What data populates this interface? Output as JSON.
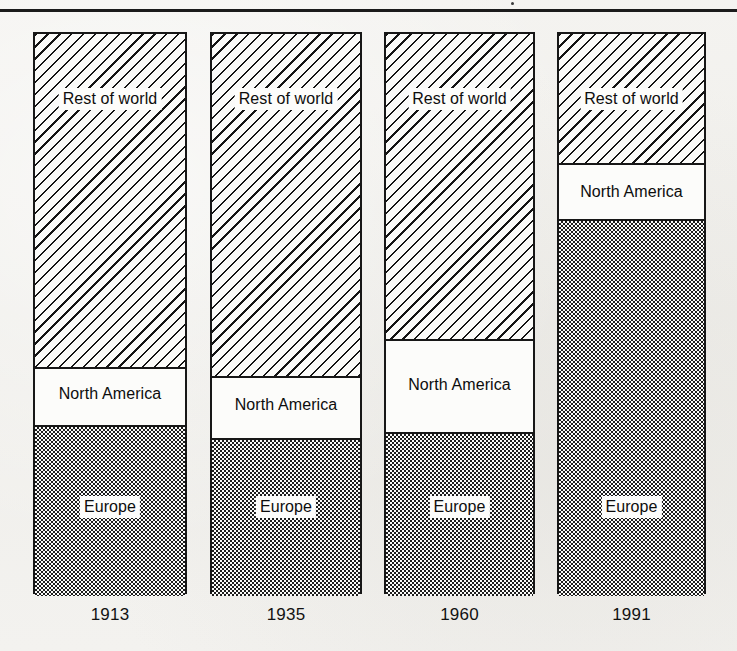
{
  "figure": {
    "background_color": "#f2f1ee",
    "ink_color": "#141414",
    "has_top_rule": true
  },
  "legend_labels": {
    "rest_of_world": "Rest of world",
    "north_america": "North America",
    "europe": "Europe"
  },
  "axis": {
    "categories": [
      "1913",
      "1935",
      "1960",
      "1991"
    ]
  },
  "bars": [
    {
      "year": "1913",
      "left": 33,
      "width": 154,
      "segments": [
        {
          "name": "rest_of_world",
          "label": "Rest of world",
          "value": 59,
          "top": 0,
          "height": 333,
          "label_y": 65,
          "pattern": "diagonal-hatch"
        },
        {
          "name": "north_america",
          "label": "North America",
          "value": 11,
          "top": 333,
          "height": 60,
          "label_y": 360,
          "pattern": "solid-white"
        },
        {
          "name": "europe",
          "label": "Europe",
          "value": 30,
          "top": 393,
          "height": 169,
          "label_y": 473,
          "pattern": "dot-screen"
        }
      ]
    },
    {
      "year": "1935",
      "left": 210,
      "width": 152,
      "segments": [
        {
          "name": "rest_of_world",
          "label": "Rest of world",
          "value": 61,
          "top": 0,
          "height": 342,
          "label_y": 65,
          "pattern": "diagonal-hatch"
        },
        {
          "name": "north_america",
          "label": "North America",
          "value": 11,
          "top": 342,
          "height": 64,
          "label_y": 371,
          "pattern": "solid-white"
        },
        {
          "name": "europe",
          "label": "Europe",
          "value": 28,
          "top": 406,
          "height": 156,
          "label_y": 473,
          "pattern": "dot-screen"
        }
      ]
    },
    {
      "year": "1960",
      "left": 384,
      "width": 151,
      "segments": [
        {
          "name": "rest_of_world",
          "label": "Rest of world",
          "value": 54,
          "top": 0,
          "height": 305,
          "label_y": 65,
          "pattern": "diagonal-hatch"
        },
        {
          "name": "north_america",
          "label": "North America",
          "value": 17,
          "top": 305,
          "height": 95,
          "label_y": 351,
          "pattern": "solid-white"
        },
        {
          "name": "europe",
          "label": "Europe",
          "value": 29,
          "top": 400,
          "height": 162,
          "label_y": 473,
          "pattern": "dot-screen"
        }
      ]
    },
    {
      "year": "1991",
      "left": 557,
      "width": 149,
      "segments": [
        {
          "name": "rest_of_world",
          "label": "Rest of world",
          "value": 23,
          "top": 0,
          "height": 129,
          "label_y": 65,
          "pattern": "diagonal-hatch"
        },
        {
          "name": "north_america",
          "label": "North America",
          "value": 10,
          "top": 129,
          "height": 58,
          "label_y": 158,
          "pattern": "solid-white"
        },
        {
          "name": "europe",
          "label": "Europe",
          "value": 67,
          "top": 187,
          "height": 375,
          "label_y": 473,
          "pattern": "dot-screen"
        }
      ]
    }
  ],
  "chart_data": {
    "type": "bar",
    "subtype": "stacked-bar-100-percent",
    "title": "",
    "subtitle": "",
    "xlabel": "",
    "ylabel": "",
    "ylim": [
      0,
      100
    ],
    "grid": false,
    "legend_position": "in-bar-labels",
    "categories": [
      "1913",
      "1935",
      "1960",
      "1991"
    ],
    "series": [
      {
        "name": "Europe",
        "pattern": "dot-screen",
        "values": [
          30,
          28,
          29,
          67
        ]
      },
      {
        "name": "North America",
        "pattern": "solid-white",
        "values": [
          11,
          11,
          17,
          10
        ]
      },
      {
        "name": "Rest of world",
        "pattern": "diagonal-hatch",
        "values": [
          59,
          61,
          54,
          23
        ]
      }
    ],
    "stack_order_bottom_to_top": [
      "Europe",
      "North America",
      "Rest of world"
    ],
    "annotations": []
  }
}
